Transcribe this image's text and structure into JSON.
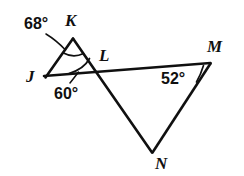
{
  "figure": {
    "background_color": "#ffffff",
    "stroke_color": "#101010",
    "width": 244,
    "height": 176
  },
  "vertices": [
    {
      "id": "J",
      "label": "J",
      "x": 45,
      "y": 77,
      "label_x": 26,
      "label_y": 68
    },
    {
      "id": "K",
      "label": "K",
      "x": 73,
      "y": 38,
      "label_x": 65,
      "label_y": 12
    },
    {
      "id": "L",
      "label": "L",
      "x": 97,
      "y": 73,
      "label_x": 99,
      "label_y": 47
    },
    {
      "id": "M",
      "label": "M",
      "x": 210,
      "y": 64,
      "label_x": 207,
      "label_y": 38
    },
    {
      "id": "N",
      "label": "N",
      "x": 152,
      "y": 152,
      "label_x": 155,
      "label_y": 155
    }
  ],
  "segments": [
    {
      "name": "segment-JK",
      "from": "J",
      "to": "K"
    },
    {
      "name": "segment-KN",
      "from": "K",
      "to": "N"
    },
    {
      "name": "segment-JM",
      "from": "J",
      "to": "M"
    },
    {
      "name": "segment-MN",
      "from": "M",
      "to": "N"
    }
  ],
  "angles": [
    {
      "id": "angle-K",
      "value": "68°",
      "label_x": 24,
      "label_y": 16,
      "vertex": "K"
    },
    {
      "id": "angle-L",
      "value": "60°",
      "label_x": 54,
      "label_y": 86,
      "vertex": "L"
    },
    {
      "id": "angle-M",
      "value": "52°",
      "label_x": 161,
      "label_y": 71,
      "vertex": "M"
    }
  ]
}
